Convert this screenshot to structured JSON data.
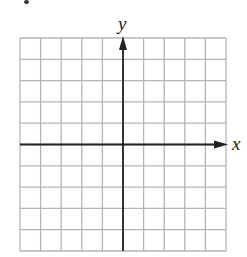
{
  "diagram": {
    "type": "coordinate-grid",
    "grid": {
      "columns": 10,
      "rows": 10,
      "left": 20,
      "top": 38,
      "right": 226,
      "bottom": 251,
      "line_color": "#b5b5b5",
      "axis_color": "#222222"
    },
    "axes": {
      "x_label": "x",
      "y_label": "y",
      "origin_col": 5,
      "origin_row": 5
    }
  }
}
